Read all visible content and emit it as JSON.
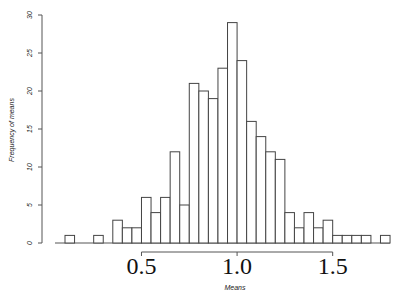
{
  "chart_data": {
    "type": "bar",
    "subtype": "histogram",
    "title": "",
    "xlabel": "Means",
    "ylabel": "Frequency of means",
    "bin_start": 0.1,
    "bin_width": 0.05,
    "bins": [
      0.1,
      0.15,
      0.2,
      0.25,
      0.3,
      0.35,
      0.4,
      0.45,
      0.5,
      0.55,
      0.6,
      0.65,
      0.7,
      0.75,
      0.8,
      0.85,
      0.9,
      0.95,
      1.0,
      1.05,
      1.1,
      1.15,
      1.2,
      1.25,
      1.3,
      1.35,
      1.4,
      1.45,
      1.5,
      1.55,
      1.6,
      1.65,
      1.7,
      1.75
    ],
    "values": [
      1,
      0,
      0,
      1,
      0,
      3,
      2,
      2,
      6,
      4,
      6,
      12,
      5,
      21,
      20,
      19,
      23,
      29,
      24,
      16,
      14,
      12,
      11,
      4,
      2,
      4,
      2,
      3,
      1,
      1,
      1,
      1,
      0,
      1
    ],
    "xticks": [
      "0.5",
      "1.0",
      "1.5"
    ],
    "yticks": [
      "0",
      "5",
      "10",
      "15",
      "20",
      "25",
      "30"
    ],
    "ylim": [
      0,
      30
    ],
    "xlim": [
      0.1,
      1.8
    ],
    "grid": false
  }
}
